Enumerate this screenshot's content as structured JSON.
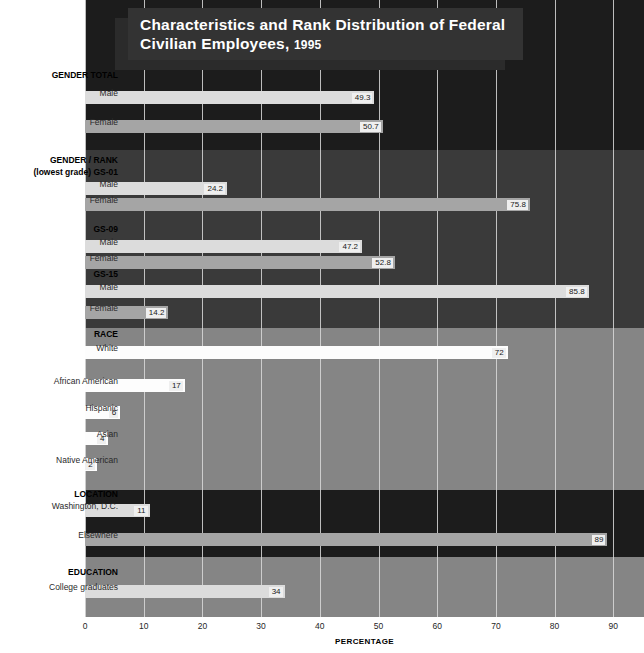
{
  "title": {
    "line1": "Characteristics and Rank Distribution of Federal",
    "line2": "Civilian Employees,",
    "year": "1995"
  },
  "axis": {
    "label": "PERCENTAGE",
    "ticks": [
      "0",
      "10",
      "20",
      "30",
      "40",
      "50",
      "60",
      "70",
      "80",
      "90"
    ]
  },
  "sections": [
    {
      "name": "GENDER TOTAL"
    },
    {
      "name": "GENDER / RANK"
    },
    {
      "name": "(lowest grade) GS-01"
    },
    {
      "name": "GS-09"
    },
    {
      "name": "GS-15"
    },
    {
      "name": "RACE"
    },
    {
      "name": "LOCATION"
    },
    {
      "name": "EDUCATION"
    }
  ],
  "rows": [
    {
      "label": "Male",
      "value": 49.3,
      "display": "49.3"
    },
    {
      "label": "Female",
      "value": 50.7,
      "display": "50.7"
    },
    {
      "label": "Male",
      "value": 24.2,
      "display": "24.2"
    },
    {
      "label": "Female",
      "value": 75.8,
      "display": "75.8"
    },
    {
      "label": "Male",
      "value": 47.2,
      "display": "47.2"
    },
    {
      "label": "Female",
      "value": 52.8,
      "display": "52.8"
    },
    {
      "label": "Male",
      "value": 85.8,
      "display": "85.8"
    },
    {
      "label": "Female",
      "value": 14.2,
      "display": "14.2"
    },
    {
      "label": "White",
      "value": 72,
      "display": "72"
    },
    {
      "label": "African American",
      "value": 17,
      "display": "17"
    },
    {
      "label": "Hispanic",
      "value": 6,
      "display": "6"
    },
    {
      "label": "Asian",
      "value": 4,
      "display": "4"
    },
    {
      "label": "Native American",
      "value": 2,
      "display": "2"
    },
    {
      "label": "Washington, D.C.",
      "value": 11,
      "display": "11"
    },
    {
      "label": "Elsewhere",
      "value": 89,
      "display": "89"
    },
    {
      "label": "College graduates",
      "value": 34,
      "display": "34"
    }
  ],
  "colors": {
    "band_black": "#1c1c1c",
    "band_dark_gray": "#3a3a3a",
    "band_mid_gray": "#858585",
    "bar_light": "#dcdcdc",
    "bar_mid": "#a5a5a5",
    "bar_white": "#fdfdfd",
    "title_box": "#333333",
    "gridline": "#d9d9d9"
  },
  "chart_data": {
    "type": "bar",
    "orientation": "horizontal",
    "title": "Characteristics and Rank Distribution of Federal Civilian Employees, 1995",
    "xlabel": "PERCENTAGE",
    "ylabel": "",
    "xlim": [
      0,
      95
    ],
    "xticks": [
      0,
      10,
      20,
      30,
      40,
      50,
      60,
      70,
      80,
      90
    ],
    "grid": true,
    "legend": "none",
    "groups": [
      {
        "group": "GENDER TOTAL",
        "categories": [
          "Male",
          "Female"
        ],
        "values": [
          49.3,
          50.7
        ]
      },
      {
        "group": "GENDER / RANK — (lowest grade) GS-01",
        "categories": [
          "Male",
          "Female"
        ],
        "values": [
          24.2,
          75.8
        ]
      },
      {
        "group": "GENDER / RANK — GS-09",
        "categories": [
          "Male",
          "Female"
        ],
        "values": [
          47.2,
          52.8
        ]
      },
      {
        "group": "GENDER / RANK — GS-15",
        "categories": [
          "Male",
          "Female"
        ],
        "values": [
          85.8,
          14.2
        ]
      },
      {
        "group": "RACE",
        "categories": [
          "White",
          "African American",
          "Hispanic",
          "Asian",
          "Native American"
        ],
        "values": [
          72,
          17,
          6,
          4,
          2
        ]
      },
      {
        "group": "LOCATION",
        "categories": [
          "Washington, D.C.",
          "Elsewhere"
        ],
        "values": [
          11,
          89
        ]
      },
      {
        "group": "EDUCATION",
        "categories": [
          "College graduates"
        ],
        "values": [
          34
        ]
      }
    ],
    "categories": [
      "Male",
      "Female",
      "Male",
      "Female",
      "Male",
      "Female",
      "Male",
      "Female",
      "White",
      "African American",
      "Hispanic",
      "Asian",
      "Native American",
      "Washington, D.C.",
      "Elsewhere",
      "College graduates"
    ],
    "values": [
      49.3,
      50.7,
      24.2,
      75.8,
      47.2,
      52.8,
      85.8,
      14.2,
      72,
      17,
      6,
      4,
      2,
      11,
      89,
      34
    ]
  },
  "layout": {
    "bands": [
      {
        "top": 0,
        "height": 150,
        "style": "black"
      },
      {
        "top": 150,
        "height": 178,
        "style": "darkgray"
      },
      {
        "top": 328,
        "height": 162,
        "style": "midgray"
      },
      {
        "top": 490,
        "height": 67,
        "style": "black"
      },
      {
        "top": 557,
        "height": 60,
        "style": "midgray"
      }
    ],
    "bar_tops": [
      91,
      120,
      182,
      198,
      240,
      256,
      285,
      306,
      346,
      379,
      406,
      432,
      458,
      504,
      533,
      585
    ],
    "bar_styles": [
      "light",
      "mid",
      "light",
      "mid",
      "light",
      "mid",
      "light",
      "mid",
      "white",
      "white",
      "white",
      "white",
      "white",
      "light",
      "mid",
      "light"
    ],
    "row_label_tops": [
      88,
      117,
      179,
      195,
      237,
      253,
      282,
      303,
      343,
      376,
      403,
      429,
      455,
      501,
      530,
      582
    ],
    "section_label_tops": [
      70,
      155,
      167,
      224,
      269,
      329,
      489,
      567
    ],
    "px_per_unit": 5.87
  }
}
